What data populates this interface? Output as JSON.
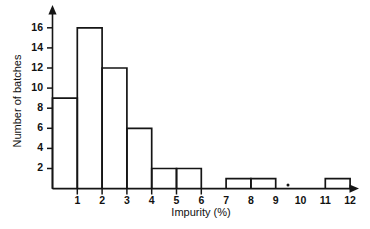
{
  "chart_data": {
    "type": "bar",
    "title": "",
    "subtitle": "",
    "xlabel": "Impurity (%)",
    "ylabel": "Number of batches",
    "categories": [
      "0-1",
      "1-2",
      "2-3",
      "3-4",
      "4-5",
      "5-6",
      "6-7",
      "7-8",
      "8-9",
      "9-10",
      "10-11",
      "11-12"
    ],
    "bin_edges": [
      0,
      1,
      2,
      3,
      4,
      5,
      6,
      7,
      8,
      9,
      10,
      11,
      12
    ],
    "values": [
      9,
      16,
      12,
      6,
      2,
      2,
      0,
      1,
      1,
      0,
      0,
      1
    ],
    "bin_width": 1,
    "xlim": [
      0,
      12
    ],
    "ylim": [
      0,
      17
    ],
    "x_ticks": [
      1,
      2,
      3,
      4,
      5,
      6,
      7,
      8,
      9,
      10,
      11,
      12
    ],
    "x_tick_labels": [
      "1",
      "2",
      "3",
      "4",
      "5",
      "6",
      "7",
      "8",
      "9",
      "10",
      "11",
      "12"
    ],
    "y_ticks": [
      2,
      4,
      6,
      8,
      10,
      12,
      14,
      16
    ],
    "y_tick_labels": [
      "2",
      "4",
      "6",
      "8",
      "10",
      "12",
      "14",
      "16"
    ],
    "grid": false,
    "legend": false,
    "legend_position": "none",
    "bar_fill": "#ffffff",
    "bar_stroke": "#151515",
    "axis_color": "#151515",
    "background": "#ffffff",
    "axis_arrows": true,
    "total_batches": 50
  }
}
